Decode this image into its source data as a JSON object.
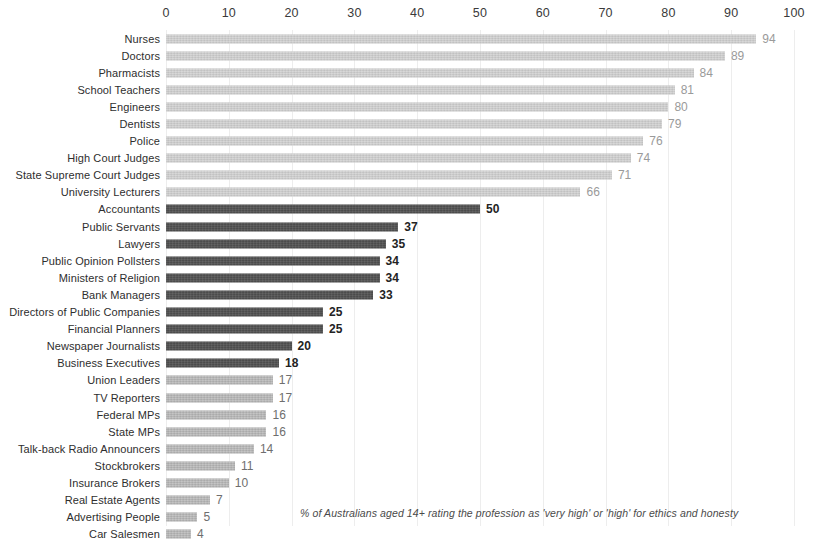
{
  "chart_data": {
    "type": "bar",
    "orientation": "horizontal",
    "title": "",
    "subtitle": "",
    "xlabel": "",
    "ylabel": "",
    "xlim": [
      0,
      100
    ],
    "xticks": [
      "0",
      "10",
      "20",
      "30",
      "40",
      "50",
      "60",
      "70",
      "80",
      "90",
      "100"
    ],
    "grid": true,
    "legend": false,
    "annotation": "% of Australians aged 14+ rating the profession as  'very high' or 'high' for ethics and honesty",
    "categories": [
      "Nurses",
      "Doctors",
      "Pharmacists",
      "School Teachers",
      "Engineers",
      "Dentists",
      "Police",
      "High Court Judges",
      "State Supreme Court Judges",
      "University Lecturers",
      "Accountants",
      "Public Servants",
      "Lawyers",
      "Public Opinion Pollsters",
      "Ministers of Religion",
      "Bank Managers",
      "Directors of Public Companies",
      "Financial Planners",
      "Newspaper Journalists",
      "Business Executives",
      "Union Leaders",
      "TV Reporters",
      "Federal MPs",
      "State MPs",
      "Talk-back Radio Announcers",
      "Stockbrokers",
      "Insurance Brokers",
      "Real Estate Agents",
      "Advertising People",
      "Car Salesmen"
    ],
    "values": [
      94,
      89,
      84,
      81,
      80,
      79,
      76,
      74,
      71,
      66,
      50,
      37,
      35,
      34,
      34,
      33,
      25,
      25,
      20,
      18,
      17,
      17,
      16,
      16,
      14,
      11,
      10,
      7,
      5,
      4
    ],
    "bar_styles": [
      "light",
      "light",
      "light",
      "light",
      "light",
      "light",
      "light",
      "light",
      "light",
      "light",
      "dark",
      "dark",
      "dark",
      "dark",
      "dark",
      "dark",
      "dark",
      "dark",
      "dark",
      "dark",
      "mid",
      "mid",
      "mid",
      "mid",
      "mid",
      "mid",
      "mid",
      "mid",
      "mid",
      "mid"
    ]
  },
  "colors": {
    "bar_light": "#b7b7b7",
    "bar_mid": "#9c9c9c",
    "bar_dark": "#3c3c3c",
    "gridline": "#ededed",
    "tick_text": "#3a3a3a",
    "label_text": "#2e2e2e",
    "value_light": "#9a9a9a",
    "value_dark": "#232323",
    "background": "#ffffff"
  }
}
